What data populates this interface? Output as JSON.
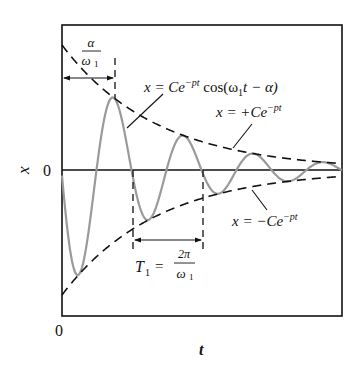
{
  "diagram": {
    "axes": {
      "x_label": "t",
      "y_label": "x",
      "x_origin_label": "0",
      "y_zero_label": "0"
    },
    "frame": {
      "left": 62,
      "top": 25,
      "right": 342,
      "bottom": 316
    },
    "zero_line_y": 170,
    "curve": {
      "equation_lhs": "x = Ce",
      "equation_exp": "−pt",
      "equation_rhs": " cos(ω",
      "equation_sub": "1",
      "equation_tail": "t − α)",
      "amplitude_px": 125,
      "decay_per_px": 0.0106,
      "period_px": 70,
      "first_peak_x": 114,
      "color": "#9a9a9a"
    },
    "upper_envelope": {
      "label_lhs": "x = +Ce",
      "label_exp": "−pt"
    },
    "lower_envelope": {
      "label_lhs": "x = −Ce",
      "label_exp": "−pt"
    },
    "phase_annotation": {
      "numerator": "α",
      "denominator": "ω",
      "denominator_sub": "1"
    },
    "period_annotation": {
      "lhs": "T",
      "lhs_sub": "1",
      "equals": "=",
      "numerator": "2π",
      "denominator": "ω",
      "denominator_sub": "1"
    },
    "colors": {
      "ink": "#111111",
      "curve": "#9a9a9a",
      "background": "#ffffff"
    }
  }
}
